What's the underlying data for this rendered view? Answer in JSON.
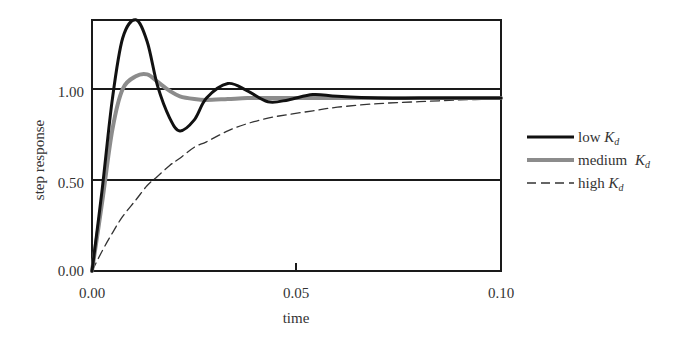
{
  "chart_data": {
    "type": "line",
    "title": "",
    "xlabel": "time",
    "ylabel": "step response",
    "xlim": [
      0.0,
      0.1
    ],
    "ylim": [
      0.0,
      1.38
    ],
    "x_ticks": [
      "0.00",
      "0.05",
      "0.10"
    ],
    "y_ticks": [
      "0.00",
      "0.50",
      "1.00"
    ],
    "gridlines_y": [
      0.5,
      1.0
    ],
    "grid": true,
    "legend_position": "right",
    "x": [
      0.0,
      0.0025,
      0.005,
      0.0075,
      0.0107,
      0.0135,
      0.016,
      0.019,
      0.0215,
      0.025,
      0.028,
      0.0332,
      0.038,
      0.043,
      0.048,
      0.054,
      0.06,
      0.07,
      0.08,
      0.09,
      0.1
    ],
    "series": [
      {
        "name": "low Kd",
        "legend_label": "low",
        "subscript": "d",
        "style": "solid",
        "color": "#111111",
        "width": 3,
        "values": [
          0.0,
          0.45,
          0.95,
          1.28,
          1.38,
          1.26,
          1.02,
          0.84,
          0.77,
          0.83,
          0.95,
          1.03,
          0.99,
          0.93,
          0.94,
          0.97,
          0.96,
          0.95,
          0.95,
          0.95,
          0.95
        ]
      },
      {
        "name": "medium Kd",
        "legend_label": "medium",
        "subscript": "d",
        "style": "solid",
        "color": "#8c8c8c",
        "width": 4,
        "values": [
          0.0,
          0.38,
          0.78,
          1.0,
          1.07,
          1.08,
          1.04,
          0.99,
          0.96,
          0.945,
          0.94,
          0.945,
          0.95,
          0.95,
          0.95,
          0.95,
          0.95,
          0.95,
          0.95,
          0.95,
          0.95
        ]
      },
      {
        "name": "high Kd",
        "legend_label": "high",
        "subscript": "d",
        "style": "dashed",
        "color": "#333333",
        "width": 1.3,
        "values": [
          0.0,
          0.11,
          0.21,
          0.3,
          0.39,
          0.47,
          0.52,
          0.58,
          0.62,
          0.68,
          0.71,
          0.77,
          0.81,
          0.84,
          0.86,
          0.88,
          0.9,
          0.92,
          0.93,
          0.94,
          0.945
        ]
      }
    ]
  },
  "layout": {
    "plot_left": 92,
    "plot_top": 20,
    "plot_right": 501,
    "plot_bottom": 271,
    "px_per_x": 4090,
    "px_per_y": 182
  }
}
